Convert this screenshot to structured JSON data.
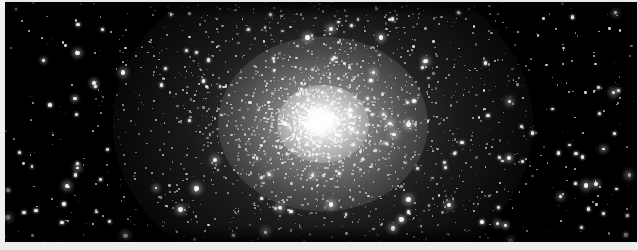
{
  "image": {
    "subject": "globular-star-cluster",
    "title": "",
    "caption": "",
    "width": 638,
    "height": 250,
    "background_color": "#000000",
    "border_color": "#efefef",
    "star_color": "#ffffff"
  },
  "plate": {
    "sky": {
      "left": 5,
      "top": 2,
      "width": 632,
      "height": 240,
      "color": "#000000"
    },
    "margins": {
      "top_px": 2,
      "left_px": 5,
      "bottom_px": 8,
      "right_px": 1,
      "color": "#efefef"
    }
  },
  "cluster": {
    "name": "",
    "center_x": 318,
    "center_y": 122,
    "core_radius_px": 46,
    "halo_radius_px": 210,
    "core_brightness": 1.0,
    "elongation": 1.27,
    "position_angle_deg": 0
  },
  "starfield": {
    "field_star_count": 520,
    "cluster_star_count": 2600,
    "bright_star_count": 46,
    "seed": 20240617
  },
  "chart_data": {
    "type": "scatter",
    "title": "",
    "xlabel": "",
    "ylabel": "",
    "xlim": [
      0,
      632
    ],
    "ylim": [
      0,
      240
    ],
    "grid": false,
    "legend": null,
    "series": [
      {
        "name": "cluster-members",
        "center": [
          318,
          122
        ],
        "count": 2600,
        "profile": "king",
        "scale_radius_px": 52,
        "axis_ratio": 0.78
      },
      {
        "name": "field-stars",
        "count": 520,
        "profile": "uniform"
      }
    ],
    "radial_profile": {
      "radius_px": [
        0,
        10,
        20,
        35,
        55,
        80,
        110,
        145,
        185,
        230
      ],
      "surface_brightness": [
        1.0,
        0.94,
        0.8,
        0.59,
        0.39,
        0.23,
        0.12,
        0.06,
        0.025,
        0.0
      ]
    }
  }
}
